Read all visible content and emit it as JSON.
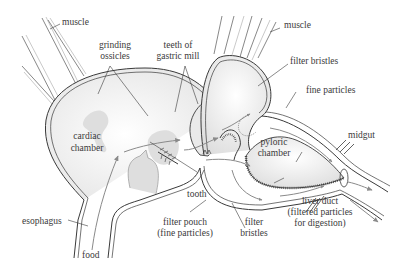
{
  "diagram": {
    "labels": {
      "muscle_left": "muscle",
      "muscle_right": "muscle",
      "grinding_ossicles_1": "grinding",
      "grinding_ossicles_2": "ossicles",
      "teeth_gastric_mill_1": "teeth of",
      "teeth_gastric_mill_2": "gastric mill",
      "filter_bristles_top": "filter bristles",
      "fine_particles": "fine particles",
      "cardiac_chamber_1": "cardiac",
      "cardiac_chamber_2": "chamber",
      "pyloric_chamber_1": "pyloric",
      "pyloric_chamber_2": "chamber",
      "midgut": "midgut",
      "tooth": "tooth",
      "esophagus": "esophagus",
      "food": "food",
      "filter_pouch_1": "filter pouch",
      "filter_pouch_2": "(fine particles)",
      "filter_bristles_bottom_1": "filter",
      "filter_bristles_bottom_2": "bristles",
      "liver_duct_1": "liver duct",
      "liver_duct_2": "(filtered particles",
      "liver_duct_3": "for digestion)"
    },
    "colors": {
      "line": "#3a3a3a",
      "stipple": "#d9d9d9",
      "arrow": "#8a8a8a",
      "background": "#ffffff"
    }
  }
}
